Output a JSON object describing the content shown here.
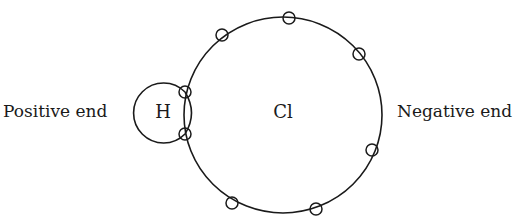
{
  "diagram": {
    "type": "electron-dot-model",
    "labels": {
      "positive_end": "Positive end",
      "negative_end": "Negative end",
      "hydrogen": "H",
      "chlorine": "Cl"
    },
    "atoms": [
      {
        "symbol": "H",
        "cx": 163,
        "cy": 113,
        "r": 30
      },
      {
        "symbol": "Cl",
        "cx": 283,
        "cy": 115,
        "r": 99
      }
    ],
    "electrons": {
      "radius": 6,
      "chlorine_unshared": [
        {
          "x": 222,
          "y": 35
        },
        {
          "x": 289,
          "y": 18
        },
        {
          "x": 359,
          "y": 54
        },
        {
          "x": 372,
          "y": 150
        },
        {
          "x": 316,
          "y": 209
        },
        {
          "x": 232,
          "y": 203
        }
      ],
      "shared_pair": [
        {
          "x": 185,
          "y": 92
        },
        {
          "x": 185,
          "y": 134
        }
      ]
    },
    "colors": {
      "stroke": "#1a1a1a",
      "background": "#ffffff"
    }
  }
}
